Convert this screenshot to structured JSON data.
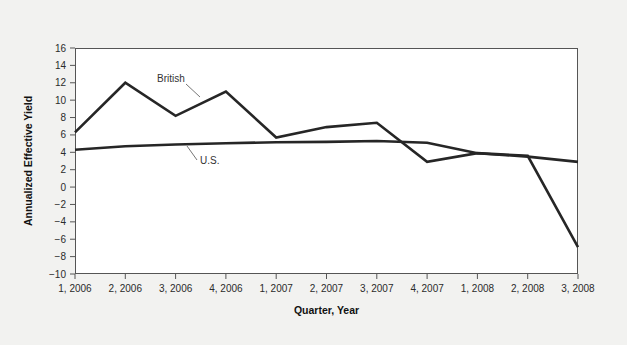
{
  "chart_data": {
    "type": "line",
    "title": "",
    "xlabel": "Quarter, Year",
    "ylabel": "Annualized Effective Yield",
    "categories": [
      "1, 2006",
      "2, 2006",
      "3, 2006",
      "4, 2006",
      "1, 2007",
      "2, 2007",
      "3, 2007",
      "4, 2007",
      "1, 2008",
      "2, 2008",
      "3, 2008"
    ],
    "yticks": [
      -10,
      -8,
      -6,
      -4,
      -2,
      0,
      2,
      4,
      6,
      8,
      10,
      12,
      14,
      16
    ],
    "ytick_labels": [
      "−10",
      "−8",
      "−6",
      "−4",
      "−2",
      "0",
      "2",
      "4",
      "6",
      "8",
      "10",
      "12",
      "14",
      "16"
    ],
    "ylim": [
      -10,
      16
    ],
    "grid": false,
    "legend_position": "inline-annotation",
    "series": [
      {
        "name": "British",
        "label": "British",
        "color": "#262626",
        "values": [
          6.3,
          12.0,
          8.2,
          11.0,
          5.7,
          6.9,
          7.4,
          2.9,
          3.9,
          3.6,
          -6.9
        ]
      },
      {
        "name": "U.S.",
        "label": "U.S.",
        "color": "#262626",
        "values": [
          4.3,
          4.7,
          4.9,
          5.05,
          5.15,
          5.2,
          5.3,
          5.1,
          3.9,
          3.5,
          2.9
        ]
      }
    ],
    "annotations": [
      {
        "text": "British",
        "series": "British",
        "anchor_index": 3
      },
      {
        "text": "U.S.",
        "series": "U.S.",
        "anchor_index": 4
      }
    ]
  },
  "colors": {
    "page_background": "#f2f2f0",
    "plot_background": "#ffffff",
    "axis": "#555555",
    "line": "#262626",
    "text": "#2b2b2b"
  }
}
